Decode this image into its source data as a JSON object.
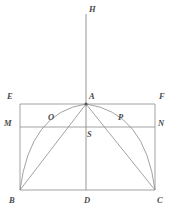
{
  "figure": {
    "kind": "geometry-diagram",
    "title": "",
    "width": 174,
    "height": 213,
    "background_color": "#ffffff",
    "stroke_color": "#8a8a8a",
    "label_color": "#4a4a4a",
    "stroke_width": 0.8
  },
  "points": {
    "H": {
      "label": "H",
      "x": 86,
      "y": 14,
      "label_x": 89,
      "label_y": 5
    },
    "A": {
      "label": "A",
      "x": 86,
      "y": 104,
      "label_x": 89,
      "label_y": 92
    },
    "E": {
      "label": "E",
      "x": 20,
      "y": 104,
      "label_x": 7,
      "label_y": 92
    },
    "F": {
      "label": "F",
      "x": 155,
      "y": 104,
      "label_x": 159,
      "label_y": 92
    },
    "M": {
      "label": "M",
      "x": 20,
      "y": 127,
      "label_x": 5,
      "label_y": 119
    },
    "N": {
      "label": "N",
      "x": 155,
      "y": 127,
      "label_x": 158,
      "label_y": 119
    },
    "O": {
      "label": "O",
      "x": 59,
      "y": 127,
      "label_x": 48,
      "label_y": 113
    },
    "P": {
      "label": "P",
      "x": 116,
      "y": 127,
      "label_x": 118,
      "label_y": 113
    },
    "S": {
      "label": "S",
      "x": 86,
      "y": 131,
      "label_x": 87,
      "label_y": 130
    },
    "B": {
      "label": "B",
      "x": 20,
      "y": 190,
      "label_x": 9,
      "label_y": 196
    },
    "D": {
      "label": "D",
      "x": 86,
      "y": 190,
      "label_x": 84,
      "label_y": 196
    },
    "C": {
      "label": "C",
      "x": 155,
      "y": 190,
      "label_x": 157,
      "label_y": 196
    }
  },
  "segments": [
    {
      "name": "axis-HD",
      "from": "H",
      "to": "D",
      "style": "straight"
    },
    {
      "name": "side-EF",
      "from": "E",
      "to": "F",
      "style": "straight"
    },
    {
      "name": "side-MN",
      "from": "M",
      "to": "N",
      "style": "straight"
    },
    {
      "name": "side-BC",
      "from": "B",
      "to": "C",
      "style": "straight"
    },
    {
      "name": "side-EB",
      "from": "E",
      "to": "B",
      "style": "straight"
    },
    {
      "name": "side-FC",
      "from": "F",
      "to": "C",
      "style": "straight"
    },
    {
      "name": "chord-AB",
      "from": "A",
      "to": "B",
      "style": "straight"
    },
    {
      "name": "chord-AC",
      "from": "A",
      "to": "C",
      "style": "straight"
    }
  ],
  "curves": [
    {
      "name": "arc-AB",
      "from": "A",
      "to": "B",
      "control_x": 30,
      "control_y": 112,
      "style": "curved"
    },
    {
      "name": "arc-AC",
      "from": "A",
      "to": "C",
      "control_x": 145,
      "control_y": 112,
      "style": "curved"
    }
  ]
}
